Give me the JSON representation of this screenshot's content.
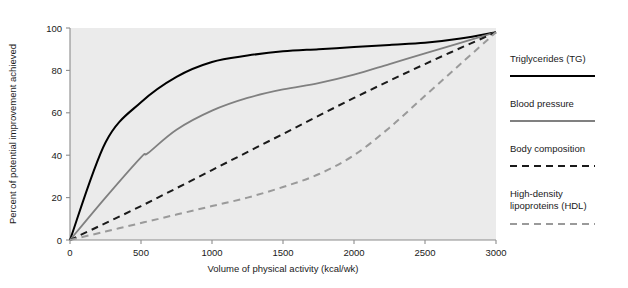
{
  "chart_data": {
    "type": "line",
    "title": "",
    "xlabel": "Volume of physical activity (kcal/wk)",
    "ylabel": "Percent of potential improvement achieved",
    "xlim": [
      0,
      3000
    ],
    "ylim": [
      0,
      100
    ],
    "xticks": [
      0,
      500,
      1000,
      1500,
      2000,
      2500,
      3000
    ],
    "xtick_labels": [
      "0",
      "500",
      "1000",
      "1500",
      "2000",
      "2500",
      "3000"
    ],
    "yticks": [
      0,
      20,
      40,
      60,
      80,
      100
    ],
    "ytick_labels": [
      "0",
      "20",
      "40",
      "60",
      "80",
      "100"
    ],
    "grid": false,
    "legend_position": "right",
    "plot_background": "#ebebeb",
    "series": [
      {
        "name": "Triglycerides (TG)",
        "color": "#000000",
        "style": "solid",
        "width": 2.0,
        "x": [
          0,
          250,
          500,
          750,
          1000,
          1250,
          1500,
          1750,
          2000,
          2250,
          2500,
          2750,
          3000
        ],
        "values": [
          0,
          46,
          65,
          77,
          84,
          87,
          89,
          90,
          91,
          92,
          93,
          95,
          98
        ]
      },
      {
        "name": "Blood pressure",
        "color": "#808080",
        "style": "solid",
        "width": 1.8,
        "x": [
          0,
          250,
          500,
          550,
          750,
          1000,
          1250,
          1500,
          1750,
          2000,
          2250,
          2500,
          2750,
          3000
        ],
        "values": [
          0,
          20,
          39,
          41,
          52,
          61,
          67,
          71,
          74,
          78,
          83,
          88,
          93,
          98
        ]
      },
      {
        "name": "Body composition",
        "color": "#1a1a1a",
        "style": "dashed",
        "width": 2.0,
        "dash": "7,5",
        "x": [
          0,
          500,
          1000,
          1500,
          2000,
          2500,
          3000
        ],
        "values": [
          0,
          16,
          33,
          50,
          67,
          83,
          98
        ]
      },
      {
        "name": "High-density lipoproteins (HDL)",
        "color": "#9a9a9a",
        "style": "dashed",
        "width": 2.0,
        "dash": "7,5",
        "x": [
          0,
          250,
          500,
          750,
          1000,
          1250,
          1500,
          1750,
          2000,
          2250,
          2500,
          2750,
          3000
        ],
        "values": [
          0,
          4,
          8,
          12,
          16,
          20,
          25,
          31,
          40,
          53,
          68,
          83,
          98
        ]
      }
    ]
  },
  "legend": {
    "items": [
      {
        "label": "Triglycerides (TG)",
        "label2": ""
      },
      {
        "label": "Blood pressure",
        "label2": ""
      },
      {
        "label": "Body composition",
        "label2": ""
      },
      {
        "label": "High-density",
        "label2": "lipoproteins (HDL)"
      }
    ]
  }
}
